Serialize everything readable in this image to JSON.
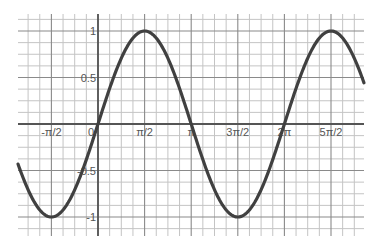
{
  "chart_data": {
    "type": "line",
    "title": "",
    "xlabel": "",
    "ylabel": "",
    "function": "y = sin(x)",
    "xlim": [
      -1.7,
      3.8
    ],
    "xlim_units": "multiples of pi",
    "ylim": [
      -1.18,
      1.18
    ],
    "grid": true,
    "legend": null,
    "x_ticks": [
      {
        "value": -1.5708,
        "label": "-π/2"
      },
      {
        "value": 0,
        "label": "0"
      },
      {
        "value": 1.5708,
        "label": "π/2"
      },
      {
        "value": 3.1416,
        "label": "π"
      },
      {
        "value": 4.7124,
        "label": "3π/2"
      },
      {
        "value": 6.2832,
        "label": "2π"
      },
      {
        "value": 7.854,
        "label": "5π/2"
      }
    ],
    "y_ticks": [
      {
        "value": 1,
        "label": "1"
      },
      {
        "value": 0.5,
        "label": "0.5"
      },
      {
        "value": -0.5,
        "label": "-0.5"
      },
      {
        "value": -1,
        "label": "-1"
      }
    ],
    "series": [
      {
        "name": "sin(x)",
        "color": "#404040",
        "x": [
          -2.67,
          -1.5708,
          0,
          1.5708,
          3.1416,
          4.7124,
          6.2832,
          7.854,
          8.93
        ],
        "values": [
          -0.45,
          -1,
          0,
          1,
          0,
          -1,
          0,
          1,
          0.45
        ]
      }
    ]
  },
  "colors": {
    "curve": "#404040",
    "axis": "#555555",
    "major_grid": "#8a8a8a",
    "minor_grid": "#c4c4c4",
    "background": "#ffffff"
  }
}
